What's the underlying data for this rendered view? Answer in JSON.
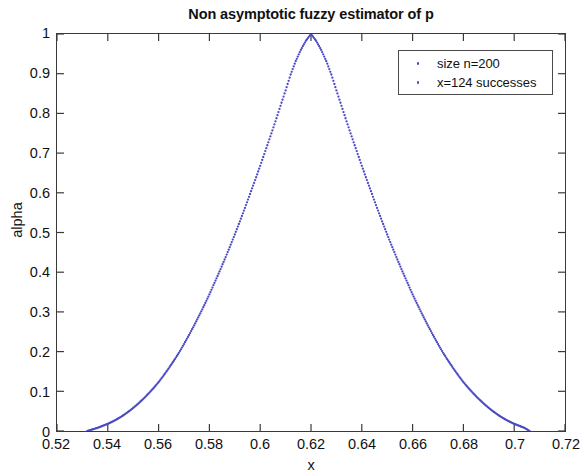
{
  "chart_data": {
    "type": "scatter",
    "title": "Non asymptotic fuzzy estimator of p",
    "xlabel": "x",
    "ylabel": "alpha",
    "xlim": [
      0.52,
      0.72
    ],
    "ylim": [
      0,
      1
    ],
    "xticks": [
      "0.52",
      "0.54",
      "0.56",
      "0.58",
      "0.6",
      "0.62",
      "0.64",
      "0.66",
      "0.68",
      "0.7",
      "0.72"
    ],
    "xtick_values": [
      0.52,
      0.54,
      0.56,
      0.58,
      0.6,
      0.62,
      0.64,
      0.66,
      0.68,
      0.7,
      0.72
    ],
    "yticks": [
      "0",
      "0.1",
      "0.2",
      "0.3",
      "0.4",
      "0.5",
      "0.6",
      "0.7",
      "0.8",
      "0.9",
      "1"
    ],
    "ytick_values": [
      0,
      0.1,
      0.2,
      0.3,
      0.4,
      0.5,
      0.6,
      0.7,
      0.8,
      0.9,
      1
    ],
    "grid": false,
    "legend_position": "top-right",
    "legend": [
      "size n=200",
      "x=124 successes"
    ],
    "marker_color": "#4a4ac4",
    "marker_style": "dotted-point",
    "series": [
      {
        "name": "size n=200",
        "peak_x": 0.62,
        "peak_y": 1,
        "left_support_x": 0.532,
        "right_support_x": 0.706,
        "points": [
          {
            "x": 0.532,
            "y": 0.0
          },
          {
            "x": 0.534,
            "y": 0.004
          },
          {
            "x": 0.536,
            "y": 0.008
          },
          {
            "x": 0.538,
            "y": 0.013
          },
          {
            "x": 0.54,
            "y": 0.018
          },
          {
            "x": 0.542,
            "y": 0.024
          },
          {
            "x": 0.544,
            "y": 0.031
          },
          {
            "x": 0.546,
            "y": 0.039
          },
          {
            "x": 0.548,
            "y": 0.048
          },
          {
            "x": 0.55,
            "y": 0.058
          },
          {
            "x": 0.552,
            "y": 0.069
          },
          {
            "x": 0.554,
            "y": 0.081
          },
          {
            "x": 0.556,
            "y": 0.094
          },
          {
            "x": 0.558,
            "y": 0.108
          },
          {
            "x": 0.56,
            "y": 0.123
          },
          {
            "x": 0.562,
            "y": 0.14
          },
          {
            "x": 0.564,
            "y": 0.158
          },
          {
            "x": 0.566,
            "y": 0.177
          },
          {
            "x": 0.568,
            "y": 0.197
          },
          {
            "x": 0.57,
            "y": 0.219
          },
          {
            "x": 0.572,
            "y": 0.242
          },
          {
            "x": 0.574,
            "y": 0.266
          },
          {
            "x": 0.576,
            "y": 0.291
          },
          {
            "x": 0.578,
            "y": 0.317
          },
          {
            "x": 0.58,
            "y": 0.344
          },
          {
            "x": 0.582,
            "y": 0.373
          },
          {
            "x": 0.584,
            "y": 0.402
          },
          {
            "x": 0.586,
            "y": 0.432
          },
          {
            "x": 0.588,
            "y": 0.463
          },
          {
            "x": 0.59,
            "y": 0.495
          },
          {
            "x": 0.592,
            "y": 0.528
          },
          {
            "x": 0.594,
            "y": 0.562
          },
          {
            "x": 0.596,
            "y": 0.597
          },
          {
            "x": 0.598,
            "y": 0.632
          },
          {
            "x": 0.6,
            "y": 0.668
          },
          {
            "x": 0.602,
            "y": 0.705
          },
          {
            "x": 0.604,
            "y": 0.742
          },
          {
            "x": 0.606,
            "y": 0.78
          },
          {
            "x": 0.608,
            "y": 0.819
          },
          {
            "x": 0.61,
            "y": 0.858
          },
          {
            "x": 0.612,
            "y": 0.898
          },
          {
            "x": 0.614,
            "y": 0.932
          },
          {
            "x": 0.616,
            "y": 0.96
          },
          {
            "x": 0.618,
            "y": 0.983
          },
          {
            "x": 0.62,
            "y": 1.0
          },
          {
            "x": 0.622,
            "y": 0.983
          },
          {
            "x": 0.624,
            "y": 0.96
          },
          {
            "x": 0.626,
            "y": 0.932
          },
          {
            "x": 0.628,
            "y": 0.898
          },
          {
            "x": 0.63,
            "y": 0.858
          },
          {
            "x": 0.632,
            "y": 0.819
          },
          {
            "x": 0.634,
            "y": 0.78
          },
          {
            "x": 0.636,
            "y": 0.742
          },
          {
            "x": 0.638,
            "y": 0.705
          },
          {
            "x": 0.64,
            "y": 0.668
          },
          {
            "x": 0.642,
            "y": 0.632
          },
          {
            "x": 0.644,
            "y": 0.597
          },
          {
            "x": 0.646,
            "y": 0.562
          },
          {
            "x": 0.648,
            "y": 0.528
          },
          {
            "x": 0.65,
            "y": 0.495
          },
          {
            "x": 0.652,
            "y": 0.463
          },
          {
            "x": 0.654,
            "y": 0.432
          },
          {
            "x": 0.656,
            "y": 0.402
          },
          {
            "x": 0.658,
            "y": 0.373
          },
          {
            "x": 0.66,
            "y": 0.344
          },
          {
            "x": 0.662,
            "y": 0.317
          },
          {
            "x": 0.664,
            "y": 0.291
          },
          {
            "x": 0.666,
            "y": 0.266
          },
          {
            "x": 0.668,
            "y": 0.242
          },
          {
            "x": 0.67,
            "y": 0.219
          },
          {
            "x": 0.672,
            "y": 0.197
          },
          {
            "x": 0.674,
            "y": 0.177
          },
          {
            "x": 0.676,
            "y": 0.158
          },
          {
            "x": 0.678,
            "y": 0.14
          },
          {
            "x": 0.68,
            "y": 0.123
          },
          {
            "x": 0.682,
            "y": 0.108
          },
          {
            "x": 0.684,
            "y": 0.094
          },
          {
            "x": 0.686,
            "y": 0.081
          },
          {
            "x": 0.688,
            "y": 0.069
          },
          {
            "x": 0.69,
            "y": 0.058
          },
          {
            "x": 0.692,
            "y": 0.048
          },
          {
            "x": 0.694,
            "y": 0.039
          },
          {
            "x": 0.696,
            "y": 0.031
          },
          {
            "x": 0.698,
            "y": 0.024
          },
          {
            "x": 0.7,
            "y": 0.018
          },
          {
            "x": 0.702,
            "y": 0.013
          },
          {
            "x": 0.704,
            "y": 0.008
          },
          {
            "x": 0.706,
            "y": 0.0
          }
        ]
      }
    ]
  }
}
